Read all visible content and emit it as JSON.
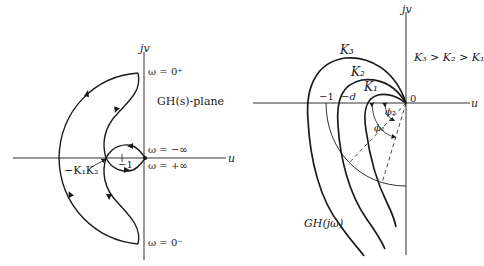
{
  "left_plot": {
    "axis_v_label": "jv",
    "axis_h_label": "u",
    "plane_label": "GH(s)-plane",
    "omega_top": "ω = 0⁺",
    "omega_bottom": "ω = 0⁻",
    "omega_neg_inf": "ω = −∞",
    "omega_pos_inf": "ω = +∞",
    "crossing_label": "−K₁K₂",
    "minus_one_label": "−1"
  },
  "right_plot": {
    "axis_v_label": "jv",
    "axis_h_label": "u",
    "origin_label": "0",
    "gain_relation": "K₃ > K₂ > K₁",
    "curve_labels": [
      "K₃",
      "K₂",
      "K₁"
    ],
    "minus_one_label": "−1",
    "minus_d_label": "−d",
    "angle_labels": [
      "ϕ₂",
      "ϕ₁"
    ],
    "locus_label": "GH(jω)"
  },
  "colors": {
    "line": "#1a1a1a",
    "background": "#ffffff"
  }
}
